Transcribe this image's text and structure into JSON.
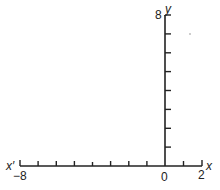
{
  "diagram": {
    "type": "coordinate-axes",
    "x_axis": {
      "left_label": "x′",
      "right_label": "x",
      "min": -8,
      "max": 2,
      "tick_step": 1,
      "labeled_ticks": [
        {
          "value": -8,
          "text": "−8"
        },
        {
          "value": 0,
          "text": "0"
        },
        {
          "value": 2,
          "text": "2"
        }
      ]
    },
    "y_axis": {
      "label": "y",
      "min": 0,
      "max": 8,
      "tick_step": 1,
      "labeled_ticks": [
        {
          "value": 8,
          "text": "8"
        }
      ]
    },
    "color": "#222222"
  }
}
